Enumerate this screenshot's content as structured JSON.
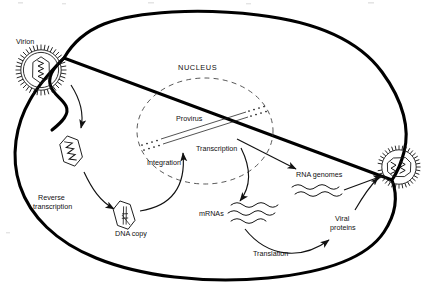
{
  "figure": {
    "background_color": "#ffffff",
    "ink_color": "#111111",
    "width": 428,
    "height": 291
  },
  "labels": {
    "virion": "Virion",
    "nucleus": "NUCLEUS",
    "provirus": "Provirus",
    "integration": "Integration",
    "transcription": "Transcription",
    "reverse_transcription_line1": "Reverse",
    "reverse_transcription_line2": "transcription",
    "dna_copy": "DNA copy",
    "mrnas": "mRNAs",
    "rna_genomes": "RNA genomes",
    "viral_proteins_line1": "Viral",
    "viral_proteins_line2": "proteins",
    "translation": "Translation"
  },
  "structures": {
    "cell_membrane": "cell-membrane-outline",
    "nuclear_envelope": "nuclear-envelope-dashed-circle",
    "entering_virion": "enveloped-virion-with-spikes",
    "budding_virion": "budding-virion-with-spikes",
    "uncoated_capsid": "capsid-with-rna-genome",
    "dna_copy_capsid": "capsid-with-dna-copy",
    "provirus_dna": "integrated-provirus-double-strand",
    "host_chromosome_ends": "dotted-chromosome-arms",
    "mrna_strands_count": 3,
    "rna_genome_strands_count": 2
  },
  "arrows": [
    {
      "name": "entry-arrow",
      "from": "virion",
      "to": "uncoated-capsid"
    },
    {
      "name": "reverse-transcription-arrow",
      "from": "capsid",
      "to": "dna-copy"
    },
    {
      "name": "integration-arrow",
      "from": "dna-copy",
      "to": "provirus"
    },
    {
      "name": "transcription-arrow",
      "from": "provirus",
      "to": "rna-genomes"
    },
    {
      "name": "transcription-mrna-arrow",
      "from": "provirus",
      "to": "mrnas"
    },
    {
      "name": "translation-arrow",
      "from": "mrnas",
      "to": "viral-proteins"
    },
    {
      "name": "assembly-rna-arrow",
      "from": "rna-genomes",
      "to": "budding-virion"
    },
    {
      "name": "assembly-protein-arrow",
      "from": "viral-proteins",
      "to": "budding-virion"
    }
  ]
}
